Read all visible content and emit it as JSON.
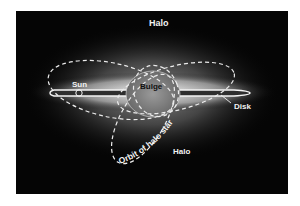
{
  "diagram": {
    "colors": {
      "background": "#050505",
      "glow": "#ffffff",
      "disk": "#3a3a3a",
      "bulge": "#8a8a8a",
      "orbit": "#e8e8e8",
      "label": "#f2f2f2"
    },
    "labels": {
      "halo_top": "Halo",
      "sun": "Sun",
      "bulge": "Bulge",
      "disk": "Disk",
      "orbit": "Orbit of halo star",
      "halo_bottom": "Halo"
    }
  }
}
